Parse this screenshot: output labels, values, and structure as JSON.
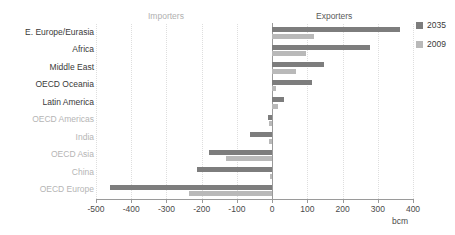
{
  "captions": {
    "clipped_top": "",
    "importers": "Importers",
    "exporters": "Exporters"
  },
  "legend": {
    "position": "right",
    "items": [
      {
        "label": "2035",
        "color": "#7d7d7d"
      },
      {
        "label": "2009",
        "color": "#b9b9b9"
      }
    ]
  },
  "axis": {
    "unit": "bcm",
    "ticks": [
      "-500",
      "-400",
      "-300",
      "-200",
      "-100",
      "0",
      "100",
      "200",
      "300",
      "400"
    ]
  },
  "categories": [
    {
      "label": "E. Europe/Eurasia",
      "side": "exporter"
    },
    {
      "label": "Africa",
      "side": "exporter"
    },
    {
      "label": "Middle East",
      "side": "exporter"
    },
    {
      "label": "OECD Oceania",
      "side": "exporter"
    },
    {
      "label": "Latin America",
      "side": "exporter"
    },
    {
      "label": "OECD Americas",
      "side": "importer"
    },
    {
      "label": "India",
      "side": "importer"
    },
    {
      "label": "OECD Asia",
      "side": "importer"
    },
    {
      "label": "China",
      "side": "importer"
    },
    {
      "label": "OECD Europe",
      "side": "importer"
    }
  ],
  "chart_data": {
    "type": "bar",
    "orientation": "horizontal",
    "title": "",
    "xlabel": "bcm",
    "ylabel": "",
    "xlim": [
      -500,
      400
    ],
    "xticks": [
      -500,
      -400,
      -300,
      -200,
      -100,
      0,
      100,
      200,
      300,
      400
    ],
    "grid": "vertical-dotted",
    "legend_position": "right",
    "annotations": [
      "Importers",
      "Exporters"
    ],
    "categories": [
      "E. Europe/Eurasia",
      "Africa",
      "Middle East",
      "OECD Oceania",
      "Latin America",
      "OECD Americas",
      "India",
      "OECD Asia",
      "China",
      "OECD Europe"
    ],
    "series": [
      {
        "name": "2035",
        "color": "#7d7d7d",
        "values": [
          363,
          278,
          148,
          113,
          33,
          -13,
          -62,
          -178,
          -213,
          -460
        ]
      },
      {
        "name": "2009",
        "color": "#b9b9b9",
        "values": [
          120,
          95,
          68,
          10,
          17,
          -10,
          -10,
          -130,
          -5,
          -235
        ]
      }
    ]
  }
}
